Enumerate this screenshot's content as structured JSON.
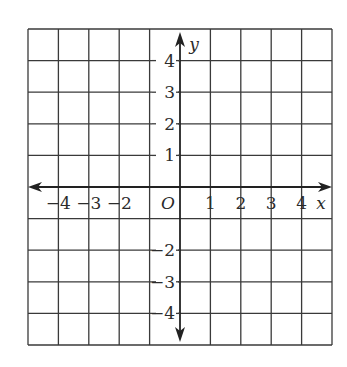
{
  "diagram": {
    "type": "coordinate-plane",
    "grid": {
      "columns": 10,
      "rows": 10,
      "x_range": [
        -5,
        5
      ],
      "y_range": [
        -5,
        5
      ],
      "line_color": "#3a3a3a"
    },
    "axes": {
      "x_label": "x",
      "y_label": "y",
      "origin_label": "O",
      "x_ticks": [
        {
          "value": -4,
          "label": "−4"
        },
        {
          "value": -3,
          "label": "−3"
        },
        {
          "value": -2,
          "label": "−2"
        },
        {
          "value": 1,
          "label": "1"
        },
        {
          "value": 2,
          "label": "2"
        },
        {
          "value": 3,
          "label": "3"
        },
        {
          "value": 4,
          "label": "4"
        }
      ],
      "y_ticks": [
        {
          "value": 4,
          "label": "4"
        },
        {
          "value": 3,
          "label": "3"
        },
        {
          "value": 2,
          "label": "2"
        },
        {
          "value": 1,
          "label": "1"
        },
        {
          "value": -2,
          "label": "−2"
        },
        {
          "value": -3,
          "label": "−3"
        },
        {
          "value": -4,
          "label": "−4"
        }
      ]
    }
  }
}
